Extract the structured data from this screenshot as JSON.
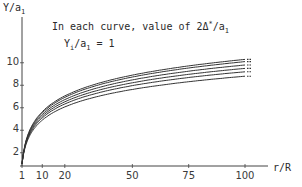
{
  "chart_data": {
    "type": "line",
    "title": "",
    "annotations": [
      "In each curve, value of 2Δ*/a1",
      "Yi/a1 = 1"
    ],
    "xlabel": "r/R",
    "ylabel": "Y/a1",
    "x_ticks": [
      1,
      10,
      20,
      50,
      75,
      100
    ],
    "y_ticks": [
      2,
      4,
      6,
      8,
      10
    ],
    "xlim": [
      1,
      110
    ],
    "ylim": [
      1,
      12
    ],
    "grid": false,
    "legend": "none",
    "x": [
      1,
      2,
      5,
      10,
      20,
      30,
      50,
      75,
      100
    ],
    "series": [
      {
        "name": "curve-1",
        "values": [
          1.0,
          2.9,
          5.4,
          6.7,
          7.8,
          8.4,
          9.1,
          9.7,
          10.3
        ]
      },
      {
        "name": "curve-2",
        "values": [
          1.0,
          2.7,
          5.1,
          6.5,
          7.6,
          8.2,
          8.9,
          9.5,
          10.1
        ]
      },
      {
        "name": "curve-3",
        "values": [
          1.0,
          2.5,
          4.8,
          6.2,
          7.3,
          7.9,
          8.6,
          9.2,
          9.8
        ]
      },
      {
        "name": "curve-4",
        "values": [
          1.0,
          2.3,
          4.5,
          5.9,
          7.0,
          7.6,
          8.3,
          8.9,
          9.5
        ]
      },
      {
        "name": "curve-5",
        "values": [
          1.0,
          2.1,
          4.2,
          5.6,
          6.7,
          7.3,
          8.0,
          8.6,
          9.2
        ]
      },
      {
        "name": "curve-6",
        "values": [
          1.0,
          1.9,
          3.9,
          5.3,
          6.4,
          7.0,
          7.6,
          8.2,
          8.8
        ]
      }
    ]
  },
  "labels": {
    "ylabel_main": "Y/a",
    "ylabel_sub": "1",
    "note_prefix": "In each curve, value of  2Δ",
    "note_sup": "*",
    "note_mid": "/a",
    "note_sub": "1",
    "note2_prefix": "Y",
    "note2_sub1": "i",
    "note2_mid": "/a",
    "note2_sub2": "1",
    "note2_suffix": " = 1",
    "xlabel": "r/R"
  },
  "ticks": {
    "x": [
      "1",
      "10",
      "20",
      "50",
      "75",
      "100"
    ],
    "y": [
      "10",
      "8",
      "6",
      "4",
      "2"
    ]
  },
  "colors": {
    "curve": "#333333",
    "axis": "#444444"
  }
}
